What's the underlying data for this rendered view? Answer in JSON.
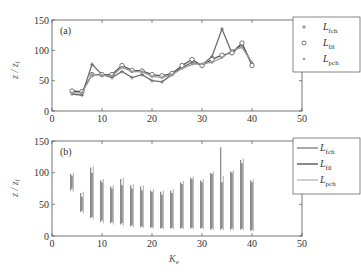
{
  "chart_data": [
    {
      "type": "line",
      "panel_label": "(a)",
      "title": "",
      "xlabel": "",
      "ylabel": "z / z_f",
      "xlim": [
        0,
        50
      ],
      "ylim": [
        0,
        150
      ],
      "xticks": [
        0,
        10,
        20,
        30,
        40,
        50
      ],
      "yticks": [
        0,
        50,
        100,
        150
      ],
      "grid": false,
      "legend_position": "upper right",
      "x": [
        4,
        6,
        8,
        10,
        12,
        14,
        16,
        18,
        20,
        22,
        24,
        26,
        28,
        30,
        32,
        34,
        36,
        38,
        40
      ],
      "series": [
        {
          "name": "L_fch",
          "marker": "plus",
          "color": "#6e6e6e",
          "values": [
            28,
            26,
            77,
            60,
            55,
            65,
            55,
            60,
            50,
            48,
            60,
            72,
            80,
            76,
            90,
            135,
            95,
            110,
            78
          ]
        },
        {
          "name": "L_fil",
          "marker": "circle",
          "color": "#555555",
          "values": [
            33,
            32,
            60,
            60,
            60,
            75,
            67,
            66,
            60,
            58,
            62,
            75,
            85,
            75,
            85,
            92,
            96,
            112,
            75
          ]
        },
        {
          "name": "L_pch",
          "marker": "dot",
          "color": "#9a9a9a",
          "values": [
            30,
            30,
            60,
            59,
            58,
            72,
            65,
            65,
            57,
            55,
            60,
            70,
            77,
            78,
            80,
            88,
            100,
            105,
            80
          ]
        }
      ]
    },
    {
      "type": "range-bars",
      "panel_label": "(b)",
      "title": "",
      "xlabel": "K_e",
      "ylabel": "z / z_f",
      "xlim": [
        0,
        50
      ],
      "ylim": [
        0,
        150
      ],
      "xticks": [
        0,
        10,
        20,
        30,
        40,
        50
      ],
      "yticks": [
        0,
        50,
        100,
        150
      ],
      "grid": false,
      "legend_position": "upper right",
      "x": [
        4,
        6,
        8,
        10,
        12,
        14,
        16,
        18,
        20,
        22,
        24,
        26,
        28,
        30,
        32,
        34,
        36,
        38,
        40
      ],
      "series": [
        {
          "name": "L_fch",
          "color": "#7a7a7a",
          "min": [
            72,
            38,
            28,
            22,
            20,
            18,
            15,
            14,
            13,
            12,
            12,
            12,
            12,
            12,
            10,
            10,
            10,
            10,
            8
          ],
          "max": [
            98,
            68,
            108,
            88,
            78,
            90,
            80,
            78,
            72,
            70,
            72,
            85,
            92,
            88,
            100,
            140,
            102,
            120,
            88
          ]
        },
        {
          "name": "L_fil",
          "color": "#4a4a4a",
          "min": [
            75,
            40,
            30,
            25,
            22,
            20,
            17,
            15,
            14,
            13,
            13,
            13,
            13,
            13,
            12,
            12,
            12,
            12,
            10
          ],
          "max": [
            95,
            62,
            100,
            85,
            75,
            80,
            75,
            72,
            70,
            65,
            68,
            82,
            90,
            85,
            98,
            85,
            100,
            115,
            85
          ]
        },
        {
          "name": "L_pch",
          "color": "#b5b5b5",
          "min": [
            70,
            36,
            26,
            20,
            18,
            16,
            14,
            13,
            12,
            11,
            11,
            11,
            11,
            11,
            9,
            9,
            9,
            9,
            7
          ],
          "max": [
            100,
            70,
            110,
            90,
            80,
            92,
            82,
            80,
            74,
            72,
            74,
            87,
            94,
            90,
            102,
            95,
            104,
            122,
            90
          ]
        }
      ]
    }
  ],
  "panels": {
    "a": {
      "label": "(a)"
    },
    "b": {
      "label": "(b)"
    }
  },
  "axes": {
    "ylabel": "z / z",
    "ylabel_sub": "f",
    "xlabel": "K",
    "xlabel_sub": "e",
    "xticks": [
      "0",
      "10",
      "20",
      "30",
      "40",
      "50"
    ],
    "yticks": [
      "0",
      "50",
      "100",
      "150"
    ]
  },
  "legend": {
    "items": [
      {
        "main": "L",
        "sub": "fch"
      },
      {
        "main": "L",
        "sub": "fil"
      },
      {
        "main": "L",
        "sub": "pch"
      }
    ]
  }
}
